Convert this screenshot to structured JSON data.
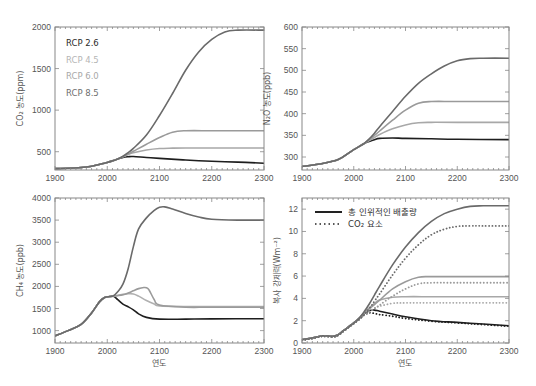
{
  "figure": {
    "xlabel": "연도",
    "legend_rcp": [
      "RCP 2.6",
      "RCP 4.5",
      "RCP 6.0",
      "RCP 8.5"
    ],
    "legend_rcp_colors": [
      "#2a2a2a",
      "#b5b5b5",
      "#a8a8a8",
      "#6e6e6e"
    ],
    "legend_forcing": [
      "총 인위적인 배출량",
      "CO₂ 요소"
    ]
  },
  "chart_data": [
    {
      "type": "line",
      "id": "co2",
      "title": "",
      "xlabel": "",
      "ylabel": "CO₂ 농도(ppm)",
      "xlim": [
        1900,
        2300
      ],
      "ylim": [
        280,
        2000
      ],
      "xticks": [
        1900,
        2000,
        2100,
        2200,
        2300
      ],
      "yticks": [
        500,
        1000,
        1500,
        2000
      ],
      "legend": [
        "RCP 2.6",
        "RCP 4.5",
        "RCP 6.0",
        "RCP 8.5"
      ],
      "legend_position": "upper left",
      "grid": false,
      "series": [
        {
          "name": "RCP 2.6",
          "color": "#1e1e1e",
          "x": [
            1900,
            1950,
            1970,
            1990,
            2000,
            2010,
            2020,
            2030,
            2040,
            2050,
            2075,
            2100,
            2150,
            2200,
            2250,
            2300
          ],
          "y": [
            296,
            310,
            325,
            355,
            370,
            390,
            412,
            432,
            440,
            442,
            430,
            420,
            400,
            385,
            375,
            362
          ]
        },
        {
          "name": "RCP 4.5",
          "color": "#a8a8a8",
          "x": [
            1900,
            1950,
            1970,
            1990,
            2000,
            2010,
            2020,
            2030,
            2040,
            2050,
            2075,
            2100,
            2125,
            2150,
            2200,
            2250,
            2300
          ],
          "y": [
            296,
            310,
            325,
            355,
            370,
            390,
            412,
            438,
            465,
            487,
            520,
            538,
            543,
            545,
            545,
            545,
            545
          ]
        },
        {
          "name": "RCP 6.0",
          "color": "#9a9a9a",
          "x": [
            1900,
            1950,
            1970,
            1990,
            2000,
            2010,
            2020,
            2030,
            2040,
            2050,
            2075,
            2100,
            2125,
            2150,
            2200,
            2250,
            2300
          ],
          "y": [
            296,
            310,
            325,
            355,
            370,
            390,
            412,
            440,
            472,
            505,
            590,
            670,
            735,
            752,
            752,
            752,
            752
          ]
        },
        {
          "name": "RCP 8.5",
          "color": "#6a6a6a",
          "x": [
            1900,
            1950,
            1970,
            1990,
            2000,
            2010,
            2020,
            2030,
            2040,
            2050,
            2075,
            2100,
            2125,
            2150,
            2175,
            2200,
            2225,
            2250,
            2300
          ],
          "y": [
            296,
            310,
            325,
            355,
            370,
            390,
            412,
            445,
            490,
            540,
            700,
            935,
            1200,
            1480,
            1700,
            1850,
            1940,
            1962,
            1962
          ]
        }
      ]
    },
    {
      "type": "line",
      "id": "n2o",
      "ylabel": "N₂O 농도(ppb)",
      "xlim": [
        1900,
        2300
      ],
      "ylim": [
        270,
        600
      ],
      "xticks": [
        1900,
        2000,
        2100,
        2200,
        2300
      ],
      "yticks": [
        300,
        350,
        400,
        450,
        500,
        550,
        600
      ],
      "grid": false,
      "series": [
        {
          "name": "RCP 2.6",
          "color": "#1e1e1e",
          "x": [
            1900,
            1940,
            1970,
            1990,
            2000,
            2010,
            2020,
            2030,
            2040,
            2050,
            2075,
            2100,
            2150,
            2200,
            2300
          ],
          "y": [
            278,
            285,
            294,
            309,
            317,
            324,
            331,
            336,
            340,
            343,
            344,
            343,
            342,
            341,
            340
          ]
        },
        {
          "name": "RCP 4.5",
          "color": "#a8a8a8",
          "x": [
            1900,
            1940,
            1970,
            1990,
            2000,
            2010,
            2020,
            2030,
            2040,
            2050,
            2075,
            2100,
            2125,
            2150,
            2200,
            2300
          ],
          "y": [
            278,
            285,
            294,
            309,
            317,
            324,
            331,
            338,
            345,
            352,
            365,
            374,
            379,
            380,
            380,
            380
          ]
        },
        {
          "name": "RCP 6.0",
          "color": "#9a9a9a",
          "x": [
            1900,
            1940,
            1970,
            1990,
            2000,
            2010,
            2020,
            2030,
            2040,
            2050,
            2075,
            2100,
            2125,
            2150,
            2200,
            2300
          ],
          "y": [
            278,
            285,
            294,
            309,
            317,
            324,
            331,
            340,
            350,
            360,
            385,
            408,
            424,
            428,
            428,
            428
          ]
        },
        {
          "name": "RCP 8.5",
          "color": "#6a6a6a",
          "x": [
            1900,
            1940,
            1970,
            1990,
            2000,
            2010,
            2020,
            2030,
            2040,
            2050,
            2075,
            2100,
            2125,
            2150,
            2175,
            2200,
            2225,
            2250,
            2300
          ],
          "y": [
            278,
            285,
            294,
            309,
            317,
            324,
            331,
            342,
            355,
            370,
            405,
            440,
            470,
            492,
            510,
            522,
            527,
            528,
            528
          ]
        }
      ]
    },
    {
      "type": "line",
      "id": "ch4",
      "xlabel": "연도",
      "ylabel": "CH₄ 농도(ppb)",
      "xlim": [
        1900,
        2300
      ],
      "ylim": [
        720,
        4000
      ],
      "xticks": [
        1900,
        2000,
        2100,
        2200,
        2300
      ],
      "yticks": [
        1000,
        1500,
        2000,
        2500,
        3000,
        3500,
        4000
      ],
      "grid": false,
      "series": [
        {
          "name": "RCP 2.6",
          "color": "#1e1e1e",
          "x": [
            1900,
            1925,
            1950,
            1970,
            1985,
            1995,
            2005,
            2012,
            2020,
            2030,
            2040,
            2050,
            2060,
            2075,
            2100,
            2150,
            2200,
            2300
          ],
          "y": [
            880,
            1000,
            1140,
            1400,
            1650,
            1750,
            1770,
            1780,
            1700,
            1600,
            1540,
            1470,
            1380,
            1300,
            1260,
            1260,
            1265,
            1270
          ]
        },
        {
          "name": "RCP 4.5",
          "color": "#b0b0b0",
          "x": [
            1900,
            1925,
            1950,
            1970,
            1985,
            1995,
            2005,
            2012,
            2020,
            2030,
            2040,
            2050,
            2060,
            2075,
            2090,
            2100,
            2150,
            2200,
            2300
          ],
          "y": [
            880,
            1000,
            1140,
            1400,
            1650,
            1750,
            1770,
            1780,
            1800,
            1820,
            1835,
            1830,
            1780,
            1680,
            1600,
            1560,
            1545,
            1545,
            1545
          ]
        },
        {
          "name": "RCP 6.0",
          "color": "#9a9a9a",
          "x": [
            1900,
            1925,
            1950,
            1970,
            1985,
            1995,
            2005,
            2012,
            2020,
            2030,
            2040,
            2050,
            2060,
            2070,
            2075,
            2080,
            2090,
            2100,
            2150,
            2200,
            2300
          ],
          "y": [
            880,
            1000,
            1140,
            1400,
            1650,
            1750,
            1770,
            1780,
            1790,
            1810,
            1850,
            1900,
            1950,
            1975,
            1970,
            1920,
            1700,
            1580,
            1530,
            1530,
            1530
          ]
        },
        {
          "name": "RCP 8.5",
          "color": "#6a6a6a",
          "x": [
            1900,
            1925,
            1950,
            1970,
            1985,
            1995,
            2005,
            2012,
            2020,
            2030,
            2040,
            2050,
            2060,
            2075,
            2090,
            2100,
            2110,
            2125,
            2150,
            2175,
            2200,
            2250,
            2300
          ],
          "y": [
            880,
            1000,
            1140,
            1400,
            1650,
            1750,
            1770,
            1790,
            1880,
            2050,
            2400,
            2900,
            3300,
            3550,
            3720,
            3790,
            3800,
            3750,
            3650,
            3570,
            3520,
            3500,
            3500
          ]
        }
      ]
    },
    {
      "type": "line",
      "id": "forcing",
      "xlabel": "연도",
      "ylabel": "복사 강제력(Wm⁻²)",
      "xlim": [
        1900,
        2300
      ],
      "ylim": [
        0,
        13
      ],
      "xticks": [
        1900,
        2000,
        2100,
        2200,
        2300
      ],
      "yticks": [
        0,
        2,
        4,
        6,
        8,
        10,
        12
      ],
      "legend": [
        "총 인위적인 배출량",
        "CO₂ 요소"
      ],
      "legend_position": "upper left",
      "grid": false,
      "series": [
        {
          "name": "총 인위적인 배출량 RCP 2.6",
          "style": "solid",
          "color": "#1e1e1e",
          "x": [
            1900,
            1920,
            1940,
            1960,
            1970,
            1980,
            1990,
            2000,
            2010,
            2020,
            2030,
            2040,
            2050,
            2075,
            2100,
            2150,
            2200,
            2250,
            2300
          ],
          "y": [
            0.3,
            0.45,
            0.65,
            0.6,
            0.75,
            1.1,
            1.45,
            1.8,
            2.2,
            2.6,
            2.9,
            2.95,
            2.85,
            2.6,
            2.35,
            2.0,
            1.85,
            1.7,
            1.55
          ]
        },
        {
          "name": "총 인위적인 배출량 RCP 4.5",
          "style": "solid",
          "color": "#a8a8a8",
          "x": [
            1900,
            1920,
            1940,
            1960,
            1970,
            1980,
            1990,
            2000,
            2010,
            2020,
            2030,
            2040,
            2050,
            2075,
            2100,
            2150,
            2200,
            2300
          ],
          "y": [
            0.3,
            0.45,
            0.65,
            0.6,
            0.75,
            1.1,
            1.45,
            1.8,
            2.2,
            2.7,
            3.15,
            3.55,
            3.85,
            4.1,
            4.15,
            4.15,
            4.15,
            4.15
          ]
        },
        {
          "name": "총 인위적인 배출량 RCP 6.0",
          "style": "solid",
          "color": "#9a9a9a",
          "x": [
            1900,
            1920,
            1940,
            1960,
            1970,
            1980,
            1990,
            2000,
            2010,
            2020,
            2030,
            2040,
            2050,
            2075,
            2100,
            2125,
            2150,
            2200,
            2300
          ],
          "y": [
            0.3,
            0.45,
            0.65,
            0.6,
            0.75,
            1.1,
            1.45,
            1.8,
            2.2,
            2.65,
            3.05,
            3.45,
            3.85,
            4.85,
            5.5,
            5.9,
            5.95,
            5.95,
            5.95
          ]
        },
        {
          "name": "총 인위적인 배출량 RCP 8.5",
          "style": "solid",
          "color": "#6a6a6a",
          "x": [
            1900,
            1920,
            1940,
            1960,
            1970,
            1980,
            1990,
            2000,
            2010,
            2020,
            2030,
            2040,
            2050,
            2075,
            2100,
            2125,
            2150,
            2175,
            2200,
            2225,
            2250,
            2300
          ],
          "y": [
            0.3,
            0.45,
            0.65,
            0.6,
            0.75,
            1.1,
            1.45,
            1.8,
            2.2,
            2.8,
            3.5,
            4.3,
            5.1,
            7.0,
            8.6,
            9.9,
            10.9,
            11.6,
            12.0,
            12.25,
            12.3,
            12.3
          ]
        },
        {
          "name": "CO₂ 요소 RCP 2.6",
          "style": "dotted",
          "color": "#1e1e1e",
          "x": [
            1900,
            1920,
            1940,
            1960,
            1970,
            1980,
            1990,
            2000,
            2010,
            2020,
            2030,
            2040,
            2050,
            2075,
            2100,
            2150,
            2200,
            2250,
            2300
          ],
          "y": [
            0.25,
            0.4,
            0.6,
            0.55,
            0.7,
            1.05,
            1.4,
            1.75,
            2.1,
            2.5,
            2.7,
            2.65,
            2.55,
            2.4,
            2.2,
            1.95,
            1.8,
            1.65,
            1.5
          ]
        },
        {
          "name": "CO₂ 요소 RCP 4.5",
          "style": "dotted",
          "color": "#a8a8a8",
          "x": [
            1900,
            1920,
            1940,
            1960,
            1970,
            1980,
            1990,
            2000,
            2010,
            2020,
            2030,
            2040,
            2050,
            2075,
            2100,
            2150,
            2200,
            2300
          ],
          "y": [
            0.25,
            0.4,
            0.6,
            0.55,
            0.7,
            1.05,
            1.4,
            1.75,
            2.1,
            2.5,
            2.85,
            3.1,
            3.3,
            3.55,
            3.6,
            3.6,
            3.6,
            3.6
          ]
        },
        {
          "name": "CO₂ 요소 RCP 6.0",
          "style": "dotted",
          "color": "#9a9a9a",
          "x": [
            1900,
            1920,
            1940,
            1960,
            1970,
            1980,
            1990,
            2000,
            2010,
            2020,
            2030,
            2040,
            2050,
            2075,
            2100,
            2125,
            2150,
            2200,
            2300
          ],
          "y": [
            0.25,
            0.4,
            0.6,
            0.55,
            0.7,
            1.05,
            1.4,
            1.75,
            2.1,
            2.5,
            2.8,
            3.1,
            3.4,
            4.2,
            4.85,
            5.3,
            5.4,
            5.4,
            5.4
          ]
        },
        {
          "name": "CO₂ 요소 RCP 8.5",
          "style": "dotted",
          "color": "#6a6a6a",
          "x": [
            1900,
            1920,
            1940,
            1960,
            1970,
            1980,
            1990,
            2000,
            2010,
            2020,
            2030,
            2040,
            2050,
            2075,
            2100,
            2125,
            2150,
            2175,
            2200,
            2225,
            2250,
            2300
          ],
          "y": [
            0.25,
            0.4,
            0.6,
            0.55,
            0.7,
            1.05,
            1.4,
            1.75,
            2.1,
            2.55,
            3.1,
            3.75,
            4.4,
            6.1,
            7.6,
            8.8,
            9.7,
            10.2,
            10.45,
            10.5,
            10.5,
            10.5
          ]
        }
      ]
    }
  ],
  "layout": {
    "panels": [
      {
        "id": "co2",
        "x0": 55,
        "x1": 264,
        "y0": 27,
        "y1": 170
      },
      {
        "id": "n2o",
        "x0": 302,
        "x1": 509,
        "y0": 27,
        "y1": 170
      },
      {
        "id": "ch4",
        "x0": 55,
        "x1": 264,
        "y0": 198,
        "y1": 343
      },
      {
        "id": "forcing",
        "x0": 302,
        "x1": 509,
        "y0": 198,
        "y1": 343
      }
    ]
  }
}
